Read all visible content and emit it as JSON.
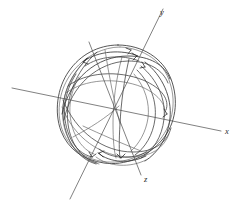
{
  "figure": {
    "background_color": "#ffffff",
    "stroke_color": "#3a3a3a",
    "axis_color": "#4a4a4a",
    "label_color": "#2b2b2b"
  },
  "axes": [
    {
      "id": "x",
      "label": "x",
      "label_x": 225,
      "label_y": 134
    },
    {
      "id": "y",
      "label": "y",
      "label_x": 160,
      "label_y": 15
    },
    {
      "id": "z",
      "label": "z",
      "label_x": 144,
      "label_y": 182
    }
  ],
  "chart_data": {
    "type": "line",
    "xlabel": "x",
    "ylabel": "y",
    "zlabel": "z",
    "grid": false,
    "legend": false,
    "sphere": {
      "center_x": 118,
      "center_y": 105,
      "radius_x": 58,
      "radius_y": 60
    },
    "axis_endpoints": {
      "x": {
        "from_x": 12,
        "from_y": 88,
        "to_x": 221,
        "to_y": 131
      },
      "y": {
        "from_x": 70,
        "from_y": 199,
        "to_x": 163,
        "to_y": 9
      },
      "z": {
        "from_x": 89,
        "from_y": 42,
        "to_x": 141,
        "to_y": 175
      }
    },
    "curve_count": 12,
    "arrow_count": 6
  }
}
